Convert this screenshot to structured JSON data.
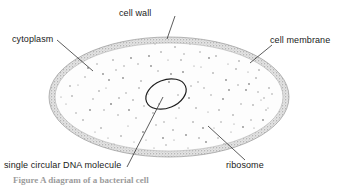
{
  "figure": {
    "caption_partial": "Figure    A diagram of a bacterial cell",
    "background_color": "#ffffff",
    "line_color": "#1a1a1a",
    "wall_fill_color": "#b8b8b8",
    "cytoplasm_fill_color": "#fdfdfd",
    "ribosome_dot_color": "#8d8d8d"
  },
  "labels": {
    "cell_wall": "cell wall",
    "cell_membrane": "cell membrane",
    "cytoplasm": "cytoplasm",
    "dna": "single circular DNA molecule",
    "ribosome": "ribosome"
  },
  "structures": {
    "cell_body": {
      "name": "bacterial cell",
      "shape": "ellipse",
      "center_x": 169,
      "center_y": 97,
      "radius_x": 120,
      "radius_y": 60
    },
    "cell_wall_band": {
      "name": "cell wall",
      "thickness_px": 6,
      "texture": "stippled"
    },
    "dna_loop": {
      "name": "single circular DNA molecule",
      "shape": "ellipse",
      "center_x": 166,
      "center_y": 94,
      "radius_x": 21,
      "radius_y": 14,
      "rotation_deg": -22
    },
    "ribosomes": {
      "name": "ribosomes",
      "representation": "small scattered dots",
      "count": 150
    }
  },
  "leader_lines": [
    {
      "name": "cell-wall-leader",
      "x1": 175,
      "y1": 16,
      "x2": 167,
      "y2": 39
    },
    {
      "name": "cell-membrane-leader",
      "x1": 272,
      "y1": 45,
      "x2": 250,
      "y2": 63
    },
    {
      "name": "cytoplasm-leader",
      "x1": 57,
      "y1": 40,
      "x2": 93,
      "y2": 71
    },
    {
      "name": "dna-leader",
      "x1": 163,
      "y1": 97,
      "x2": 127,
      "y2": 167
    },
    {
      "name": "ribosome-leader",
      "x1": 245,
      "y1": 160,
      "x2": 208,
      "y2": 126
    }
  ]
}
